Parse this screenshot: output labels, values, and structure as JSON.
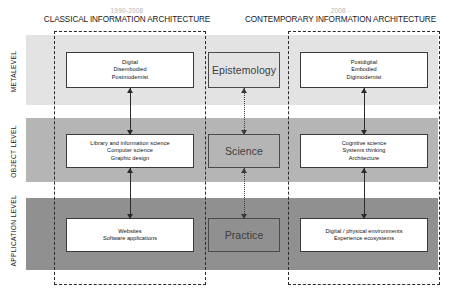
{
  "eras": [
    {
      "id": "classical",
      "years": "1990-2008",
      "name": "CLASSICAL INFORMATION ARCHITECTURE"
    },
    {
      "id": "contemporary",
      "years": "2008 -",
      "name": "CONTEMPORARY INFORMATION ARCHITECTURE"
    }
  ],
  "levels": [
    {
      "id": "metalevel",
      "label": "METALEVEL"
    },
    {
      "id": "object",
      "label": "OBJECT LEVEL"
    },
    {
      "id": "application",
      "label": "APPLICATION LEVEL"
    }
  ],
  "cells": {
    "meta_left": "Digital\nDisembodied\nPostmodernist",
    "meta_mid": "Epistemology",
    "meta_right": "Postdigital\nEmbodied\nDigimodernist",
    "obj_left": "Library and information science\nComputer science\nGraphic design",
    "obj_mid": "Science",
    "obj_right": "Cognitive science\nSystems thinking\nArchitecture",
    "app_left": "Websites\nSoftware applications",
    "app_mid": "Practice",
    "app_right": "Digital / physical environments\nExperience ecosystems"
  },
  "colors": {
    "band_metalevel": "#e3e3e3",
    "band_object": "#b5b5b5",
    "band_application": "#909090",
    "box_fill": "#ffffff",
    "box_border": "#3a3a3a",
    "era_border": "#2a2a2a",
    "years_text": "#b5b5b5",
    "heading_text": "#1a1a1a"
  }
}
